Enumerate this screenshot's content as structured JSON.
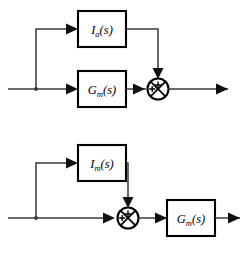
{
  "figure": {
    "type": "block-diagram",
    "background_color": "#ffffff",
    "line_color": "#3a3a3a",
    "block_border_color": "#000000",
    "diagram_count": 2
  },
  "diagrams": [
    {
      "id": "top-diagram",
      "name": "feedforward-parallel-sum",
      "blocks": [
        {
          "id": "block-ia",
          "name": "transfer-block-ia",
          "base": "I",
          "subscript": "a",
          "argument": "(s)",
          "full_label": "Ia(s)"
        },
        {
          "id": "block-gm-top",
          "name": "transfer-block-gm",
          "base": "G",
          "subscript": "m",
          "argument": "(s)",
          "full_label": "Gm(s)"
        }
      ],
      "summing_junction": {
        "id": "sum-top",
        "name": "summing-junction",
        "sign_top": "+",
        "sign_left": "+"
      },
      "signals": {
        "input_label": "",
        "output_label": ""
      }
    },
    {
      "id": "bottom-diagram",
      "name": "feedforward-sum-then-plant",
      "blocks": [
        {
          "id": "block-im",
          "name": "transfer-block-im",
          "base": "I",
          "subscript": "m",
          "argument": "(s)",
          "full_label": "Im(s)"
        },
        {
          "id": "block-gm-bottom",
          "name": "transfer-block-gm",
          "base": "G",
          "subscript": "m",
          "argument": "(s)",
          "full_label": "Gm(s)"
        }
      ],
      "summing_junction": {
        "id": "sum-bottom",
        "name": "summing-junction",
        "sign_top": "+",
        "sign_left": "+"
      },
      "signals": {
        "input_label": "",
        "output_label": ""
      }
    }
  ]
}
